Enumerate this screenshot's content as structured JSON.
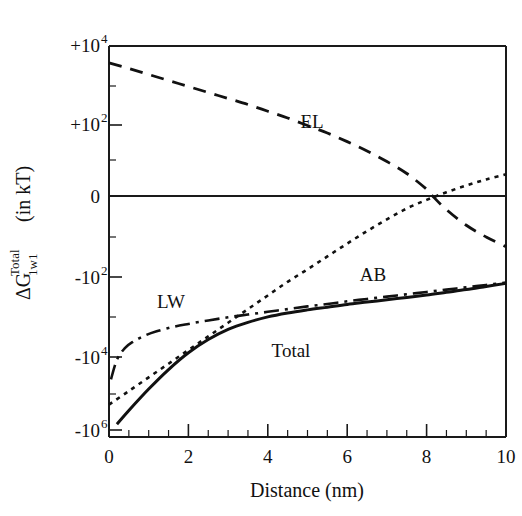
{
  "chart_data": {
    "type": "line",
    "title": "",
    "xlabel": "Distance (nm)",
    "ylabel": "ΔG",
    "ylabel_superscript": "Total",
    "ylabel_subscript": "1w1",
    "ylabel_units": "(in kT)",
    "xlim": [
      0,
      10
    ],
    "xticks": [
      0,
      2,
      4,
      6,
      8,
      10
    ],
    "xtick_labels": [
      "0",
      "2",
      "4",
      "6",
      "8",
      "10"
    ],
    "x_minor_tick_count": 4,
    "yscale": "symlog",
    "yticks": [
      "+10^4",
      "+10^2",
      "0",
      "-10^2",
      "-10^4",
      "-10^6"
    ],
    "ytick_labels": [
      {
        "sign": "+10",
        "exp": "4"
      },
      {
        "sign": "+10",
        "exp": "2"
      },
      {
        "sign": "0",
        "exp": ""
      },
      {
        "sign": "-10",
        "exp": "2"
      },
      {
        "sign": "-10",
        "exp": "4"
      },
      {
        "sign": "-10",
        "exp": "6"
      }
    ],
    "grid": false,
    "legend_position": "inline-annotations",
    "series": [
      {
        "name": "EL",
        "label": "EL",
        "style": "long-dashed",
        "color": "#111111",
        "annotation_x": 5.1,
        "annotation_y": "+10^2.9",
        "x": [
          0.0,
          0.5,
          1.0,
          1.5,
          2.0,
          2.5,
          3.0,
          3.5,
          4.0,
          4.5,
          5.0,
          5.5,
          6.0,
          6.5,
          7.0,
          7.5,
          8.0,
          8.15,
          8.5,
          9.0,
          9.5,
          10.0
        ],
        "y_decades": [
          3.55,
          3.4,
          3.24,
          3.08,
          2.92,
          2.76,
          2.6,
          2.44,
          2.26,
          2.08,
          1.88,
          1.68,
          1.45,
          1.2,
          0.92,
          0.6,
          0.18,
          0.0,
          -0.35,
          -0.75,
          -1.05,
          -1.3
        ]
      },
      {
        "name": "AB",
        "label": "AB",
        "style": "dotted",
        "color": "#111111",
        "annotation_x": 7.0,
        "annotation_y": "-10^1.9",
        "x": [
          0.0,
          0.5,
          1.0,
          1.5,
          2.0,
          2.5,
          3.0,
          3.5,
          4.0,
          4.5,
          5.0,
          5.5,
          6.0,
          6.5,
          7.0,
          7.5,
          8.0,
          8.5,
          9.0,
          9.5,
          10.0
        ],
        "y_decades": [
          -5.35,
          -5.0,
          -4.65,
          -4.3,
          -3.95,
          -3.6,
          -3.25,
          -2.9,
          -2.55,
          -2.2,
          -1.88,
          -1.55,
          -1.22,
          -0.9,
          -0.6,
          -0.32,
          -0.1,
          0.1,
          0.28,
          0.44,
          0.58
        ]
      },
      {
        "name": "LW",
        "label": "LW",
        "style": "dash-dot",
        "color": "#111111",
        "annotation_x": 1.9,
        "annotation_y": "-10^2.4",
        "x": [
          0.05,
          0.2,
          0.4,
          0.6,
          0.9,
          1.2,
          1.6,
          2.0,
          2.5,
          3.0,
          3.5,
          4.0,
          4.5,
          5.0,
          5.5,
          6.0,
          6.5,
          7.0,
          7.5,
          8.0,
          8.5,
          9.0,
          9.5,
          10.0
        ],
        "y_decades": [
          -4.7,
          -4.2,
          -3.9,
          -3.74,
          -3.58,
          -3.47,
          -3.36,
          -3.28,
          -3.19,
          -3.11,
          -3.04,
          -2.97,
          -2.9,
          -2.83,
          -2.77,
          -2.7,
          -2.64,
          -2.58,
          -2.52,
          -2.46,
          -2.4,
          -2.34,
          -2.28,
          -2.22
        ]
      },
      {
        "name": "Total",
        "label": "Total",
        "style": "solid",
        "color": "#111111",
        "annotation_x": 4.1,
        "annotation_y": "-10^3.5",
        "x": [
          0.2,
          0.5,
          1.0,
          1.5,
          2.0,
          2.5,
          3.0,
          3.5,
          4.0,
          4.5,
          5.0,
          5.5,
          6.0,
          6.5,
          7.0,
          7.5,
          8.0,
          8.5,
          9.0,
          9.5,
          10.0
        ],
        "y_decades": [
          -5.85,
          -5.5,
          -4.95,
          -4.45,
          -4.02,
          -3.68,
          -3.42,
          -3.24,
          -3.1,
          -3.0,
          -2.92,
          -2.85,
          -2.78,
          -2.72,
          -2.66,
          -2.6,
          -2.54,
          -2.47,
          -2.4,
          -2.32,
          -2.24
        ]
      }
    ]
  },
  "annotations": {
    "el": "EL",
    "ab": "AB",
    "lw": "LW",
    "total": "Total"
  },
  "axes": {
    "x_title": "Distance (nm)",
    "y_main": "ΔG",
    "y_sup": "Total",
    "y_sub": "1w1",
    "y_units": "(in kT)"
  },
  "ticks": {
    "x": [
      "0",
      "2",
      "4",
      "6",
      "8",
      "10"
    ],
    "y": [
      {
        "base": "+10",
        "exp": "4"
      },
      {
        "base": "+10",
        "exp": "2"
      },
      {
        "base": "0",
        "exp": ""
      },
      {
        "base": "-10",
        "exp": "2"
      },
      {
        "base": "-10",
        "exp": "4"
      },
      {
        "base": "-10",
        "exp": "6"
      }
    ]
  },
  "colors": {
    "ink": "#111111",
    "background": "#ffffff"
  }
}
